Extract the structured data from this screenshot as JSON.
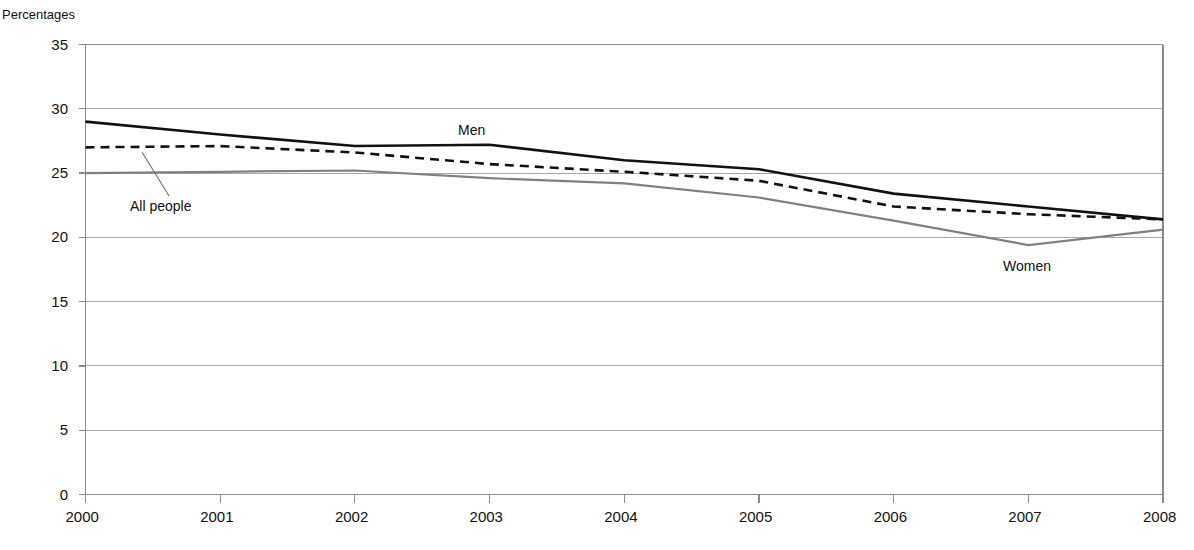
{
  "chart_data": {
    "type": "line",
    "title": "Percentages",
    "xlabel": "",
    "ylabel": "Percentages",
    "x": [
      2000,
      2001,
      2002,
      2003,
      2004,
      2005,
      2006,
      2007,
      2008
    ],
    "xtick_labels": [
      "2000",
      "2001",
      "2002",
      "2003",
      "2004",
      "2005",
      "2006",
      "2007",
      "2008"
    ],
    "ytick_labels": [
      "0",
      "5",
      "10",
      "15",
      "20",
      "25",
      "30",
      "35"
    ],
    "ytick_values": [
      0,
      5,
      10,
      15,
      20,
      25,
      30,
      35
    ],
    "ylim": [
      0,
      35
    ],
    "xlim": [
      2000,
      2008
    ],
    "grid": "horizontal",
    "legend_position": "inline-annotations",
    "series": [
      {
        "name": "Men",
        "style": "solid",
        "color": "#111111",
        "width": 2.6,
        "values": [
          29.0,
          28.0,
          27.1,
          27.2,
          26.0,
          25.3,
          23.4,
          22.4,
          21.4
        ]
      },
      {
        "name": "All people",
        "style": "dashed",
        "color": "#111111",
        "width": 2.6,
        "values": [
          27.0,
          27.1,
          26.6,
          25.7,
          25.1,
          24.4,
          22.4,
          21.8,
          21.4
        ]
      },
      {
        "name": "Women",
        "style": "solid",
        "color": "#808080",
        "width": 2.2,
        "values": [
          25.0,
          25.1,
          25.2,
          24.6,
          24.2,
          23.1,
          21.3,
          19.4,
          20.6
        ]
      }
    ],
    "annotations": [
      {
        "label": "Men",
        "series": "Men",
        "x_px": 458,
        "y_px": 122,
        "leader": false
      },
      {
        "label": "All people",
        "series": "All people",
        "x_px": 130,
        "y_px": 198,
        "leader": true
      },
      {
        "label": "Women",
        "series": "Women",
        "x_px": 1003,
        "y_px": 258,
        "leader": false
      }
    ],
    "colors": {
      "frame": "#8c8c8c",
      "gridline": "#a8a8a8",
      "men": "#111111",
      "all_people": "#111111",
      "women": "#808080",
      "leader": "#6e6e6e",
      "text": "#111111"
    }
  }
}
